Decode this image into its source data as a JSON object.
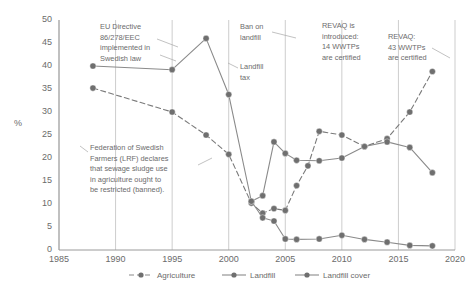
{
  "chart_data": {
    "type": "line",
    "title": "",
    "subtitle": "",
    "xlabel": "",
    "ylabel": "%",
    "xlim": [
      1985,
      2020
    ],
    "ylim": [
      0,
      50
    ],
    "xticks": [
      1985,
      1990,
      1995,
      2000,
      2005,
      2010,
      2015,
      2020
    ],
    "yticks": [
      0,
      5,
      10,
      15,
      20,
      25,
      30,
      35,
      40,
      45,
      50
    ],
    "grid": "vertical-only",
    "legend_position": "bottom",
    "series": [
      {
        "name": "Agriculture",
        "style": "dashed",
        "color": "#7a7a7a",
        "points": [
          {
            "x": 1988,
            "y": 35.2
          },
          {
            "x": 1995,
            "y": 30.0
          },
          {
            "x": 1998,
            "y": 25.0
          },
          {
            "x": 2000,
            "y": 20.8
          },
          {
            "x": 2002,
            "y": 10.2
          },
          {
            "x": 2003,
            "y": 8.0
          },
          {
            "x": 2004,
            "y": 9.0
          },
          {
            "x": 2005,
            "y": 8.6
          },
          {
            "x": 2006,
            "y": 14.0
          },
          {
            "x": 2007,
            "y": 18.3
          },
          {
            "x": 2008,
            "y": 25.8
          },
          {
            "x": 2010,
            "y": 25.0
          },
          {
            "x": 2012,
            "y": 22.5
          },
          {
            "x": 2014,
            "y": 24.2
          },
          {
            "x": 2016,
            "y": 30.0
          },
          {
            "x": 2018,
            "y": 38.8
          }
        ]
      },
      {
        "name": "Landfill",
        "style": "solid",
        "color": "#8a8a8a",
        "points": [
          {
            "x": 2002,
            "y": 10.6
          },
          {
            "x": 2003,
            "y": 11.8
          },
          {
            "x": 2004,
            "y": 23.5
          },
          {
            "x": 2005,
            "y": 21.0
          },
          {
            "x": 2006,
            "y": 19.5
          },
          {
            "x": 2008,
            "y": 19.4
          },
          {
            "x": 2010,
            "y": 20.0
          },
          {
            "x": 2012,
            "y": 22.5
          },
          {
            "x": 2014,
            "y": 23.5
          },
          {
            "x": 2016,
            "y": 22.3
          },
          {
            "x": 2018,
            "y": 16.8
          }
        ]
      },
      {
        "name": "Landfill cover",
        "style": "solid",
        "color": "#8a8a8a",
        "points": [
          {
            "x": 1988,
            "y": 40.0
          },
          {
            "x": 1995,
            "y": 39.2
          },
          {
            "x": 1998,
            "y": 46.0
          },
          {
            "x": 2000,
            "y": 33.8
          },
          {
            "x": 2002,
            "y": 10.6
          },
          {
            "x": 2003,
            "y": 7.0
          },
          {
            "x": 2004,
            "y": 6.3
          },
          {
            "x": 2005,
            "y": 2.4
          },
          {
            "x": 2006,
            "y": 2.3
          },
          {
            "x": 2008,
            "y": 2.4
          },
          {
            "x": 2010,
            "y": 3.2
          },
          {
            "x": 2012,
            "y": 2.3
          },
          {
            "x": 2014,
            "y": 1.7
          },
          {
            "x": 2016,
            "y": 1.0
          },
          {
            "x": 2018,
            "y": 0.9
          }
        ]
      }
    ],
    "annotations": [
      {
        "id": "eu-directive",
        "text": "EU Directive\n86/278/EEC\nimplemented in\nSwedish law",
        "target_x": 1995,
        "target_y": 41.5
      },
      {
        "id": "lrf-declaration",
        "text": "Federation of Swedish\nFarmers (LRF) declares\nthat sewage sludge use\nin agriculture ought to\nbe restricted (banned).",
        "target_x": 1988,
        "target_y": 16.5
      },
      {
        "id": "ban-on-landfill",
        "text": "Ban on\nlandfill",
        "target_x": 2005,
        "target_y": 47.5
      },
      {
        "id": "landfill-tax",
        "text": "Landfill\ntax",
        "target_x": 2000,
        "target_y": 39.5
      },
      {
        "id": "revaq-introduced",
        "text": "REVAQ is\nintroduced:\n14 WWTPs\nare certified",
        "target_x": 2008,
        "target_y": 48.0
      },
      {
        "id": "revaq-43",
        "text": "REVAQ:\n43 WWTPs\nare certified",
        "target_x": 2018,
        "target_y": 44.0
      }
    ]
  },
  "axes": {
    "y_title": "%",
    "y_ticks": [
      "0",
      "5",
      "10",
      "15",
      "20",
      "25",
      "30",
      "35",
      "40",
      "45",
      "50"
    ],
    "x_ticks": [
      "1985",
      "1990",
      "1995",
      "2000",
      "2005",
      "2010",
      "2015",
      "2020"
    ]
  },
  "legend": {
    "items": [
      {
        "label": "Agriculture",
        "style": "dashed"
      },
      {
        "label": "Landfill",
        "style": "solid"
      },
      {
        "label": "Landfill cover",
        "style": "solid"
      }
    ]
  },
  "annotation_text": {
    "eu_directive_l1": "EU Directive",
    "eu_directive_l2": "86/278/EEC",
    "eu_directive_l3": "implemented in",
    "eu_directive_l4": "Swedish law",
    "lrf_l1": "Federation of Swedish",
    "lrf_l2": "Farmers (LRF) declares",
    "lrf_l3": "that sewage sludge use",
    "lrf_l4": "in agriculture ought to",
    "lrf_l5": "be restricted (banned).",
    "ban_l1": "Ban on",
    "ban_l2": "landfill",
    "tax_l1": "Landfill",
    "tax_l2": "tax",
    "revaq_intro_l1": "REVAQ is",
    "revaq_intro_l2": "introduced:",
    "revaq_intro_l3": "14 WWTPs",
    "revaq_intro_l4": "are certified",
    "revaq43_l1": "REVAQ:",
    "revaq43_l2": "43 WWTPs",
    "revaq43_l3": "are certified"
  },
  "colors": {
    "line": "#8a8a8a",
    "marker": "#6f6f6f",
    "axis": "#9a9a9a",
    "grid": "#c0c0c0",
    "text": "#6b6b6b"
  }
}
